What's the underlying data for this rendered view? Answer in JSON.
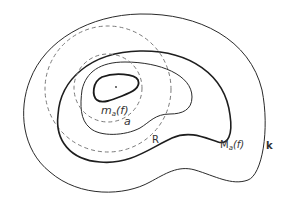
{
  "figure": {
    "labels": {
      "inner_curve": "m",
      "inner_sub": "a",
      "inner_arg": "(f)",
      "small_circle": "a",
      "large_circle": "R",
      "outer_level": "M",
      "outer_sub": "a",
      "outer_arg": "(f)",
      "boundary": "k"
    },
    "colors": {
      "stroke": "#2a2a2a",
      "dashed": "#7a7a7a",
      "background": "#ffffff"
    }
  }
}
